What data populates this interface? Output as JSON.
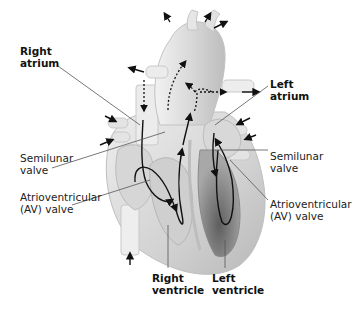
{
  "diagram": {
    "labels": {
      "right_atrium": {
        "line1": "Right",
        "line2": "atrium"
      },
      "left_atrium": {
        "line1": "Left",
        "line2": "atrium"
      },
      "semilunar_left": {
        "line1": "Semilunar",
        "line2": "valve"
      },
      "semilunar_right": {
        "line1": "Semilunar",
        "line2": "valve"
      },
      "av_left": {
        "line1": "Atrioventricular",
        "line2": "(AV) valve"
      },
      "av_right": {
        "line1": "Atrioventricular",
        "line2": "(AV) valve"
      },
      "right_ventricle": {
        "line1": "Right",
        "line2": "ventricle"
      },
      "left_ventricle": {
        "line1": "Left",
        "line2": "ventricle"
      }
    },
    "colors": {
      "heart_light": "#e6e6e6",
      "heart_mid": "#c8c8c8",
      "heart_dark": "#9a9a9a",
      "ventricle_dark": "#6e6e6e",
      "arrow": "#111111",
      "leader": "#555555"
    }
  }
}
